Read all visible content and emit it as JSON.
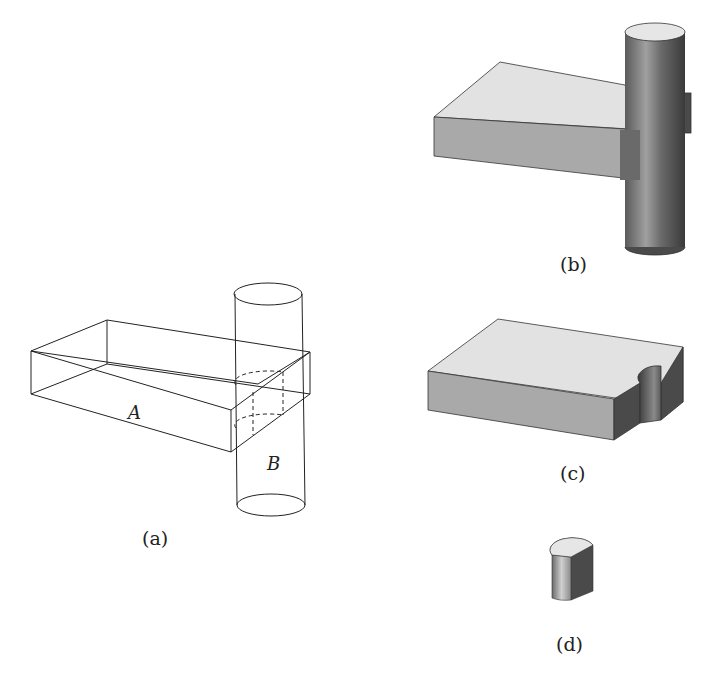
{
  "figure": {
    "panels": [
      {
        "id": "a",
        "caption": "(a)",
        "description": "Wireframe of box A overlapping cylinder B",
        "labels": {
          "box": "A",
          "cylinder": "B"
        }
      },
      {
        "id": "b",
        "caption": "(b)",
        "description": "Shaded union of box and cylinder"
      },
      {
        "id": "c",
        "caption": "(c)",
        "description": "Box with cylindrical notch removed (difference A - B)"
      },
      {
        "id": "d",
        "caption": "(d)",
        "description": "Half-cylinder intersection piece (A ∩ B)"
      }
    ],
    "colors": {
      "line": "#222222",
      "top_face": "#e2e2e2",
      "front_face": "#a9a9a9",
      "side_face": "#5a5a5a",
      "cyl_dark": "#4a4a4a",
      "cyl_light": "#b8b8b8"
    }
  }
}
